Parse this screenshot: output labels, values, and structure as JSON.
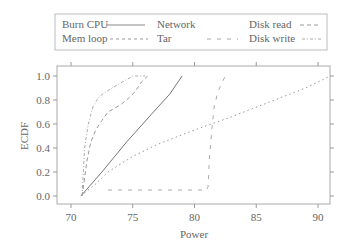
{
  "chart_data": {
    "type": "line",
    "title": "",
    "xlabel": "Power",
    "ylabel": "ECDF",
    "xlim": [
      69.2,
      91
    ],
    "ylim": [
      -0.07,
      1.08
    ],
    "xticks": [
      "70",
      "75",
      "80",
      "85",
      "90"
    ],
    "yticks": [
      "0.0",
      "0.2",
      "0.4",
      "0.6",
      "0.8",
      "1.0"
    ],
    "grid": false,
    "legend_position": "top",
    "series": [
      {
        "name": "Burn CPU",
        "style": "solid",
        "points": [
          [
            70.8,
            0.0
          ],
          [
            72.5,
            0.2
          ],
          [
            74.5,
            0.45
          ],
          [
            76.5,
            0.68
          ],
          [
            78,
            0.85
          ],
          [
            79,
            1.0
          ]
        ]
      },
      {
        "name": "Network",
        "style": "none",
        "points": []
      },
      {
        "name": "Disk read",
        "style": "dashed",
        "points": [
          [
            70.9,
            0.0
          ],
          [
            71.1,
            0.15
          ],
          [
            71.3,
            0.3
          ],
          [
            71.6,
            0.45
          ],
          [
            72,
            0.55
          ],
          [
            72.5,
            0.63
          ],
          [
            73,
            0.7
          ],
          [
            74,
            0.76
          ],
          [
            74.5,
            0.8
          ],
          [
            75.2,
            0.87
          ],
          [
            75.7,
            0.95
          ],
          [
            76.2,
            1.0
          ]
        ]
      },
      {
        "name": "Mem loop",
        "style": "dotted",
        "points": [
          [
            70.8,
            0.0
          ],
          [
            72,
            0.1
          ],
          [
            73,
            0.2
          ],
          [
            75,
            0.33
          ],
          [
            77,
            0.43
          ],
          [
            80,
            0.55
          ],
          [
            83,
            0.66
          ],
          [
            86,
            0.78
          ],
          [
            89,
            0.9
          ],
          [
            91,
            1.0
          ]
        ]
      },
      {
        "name": "Tar",
        "style": "longdash",
        "points": [
          [
            73,
            0.05
          ],
          [
            81,
            0.05
          ],
          [
            81.1,
            0.08
          ],
          [
            81.2,
            0.3
          ],
          [
            81.4,
            0.55
          ],
          [
            81.6,
            0.75
          ],
          [
            81.9,
            0.87
          ],
          [
            82.2,
            0.94
          ],
          [
            82.5,
            1.0
          ]
        ]
      },
      {
        "name": "Disk write",
        "style": "dashdot",
        "points": [
          [
            70.9,
            0.0
          ],
          [
            71.0,
            0.2
          ],
          [
            71.1,
            0.4
          ],
          [
            71.4,
            0.6
          ],
          [
            71.8,
            0.75
          ],
          [
            72.3,
            0.83
          ],
          [
            73,
            0.88
          ],
          [
            74,
            0.94
          ],
          [
            75,
            1.0
          ],
          [
            76,
            1.0
          ]
        ]
      }
    ]
  },
  "legend": {
    "items": [
      {
        "label": "Burn CPU"
      },
      {
        "label": "Network"
      },
      {
        "label": "Disk read"
      },
      {
        "label": "Mem loop"
      },
      {
        "label": "Tar"
      },
      {
        "label": "Disk write"
      }
    ]
  }
}
